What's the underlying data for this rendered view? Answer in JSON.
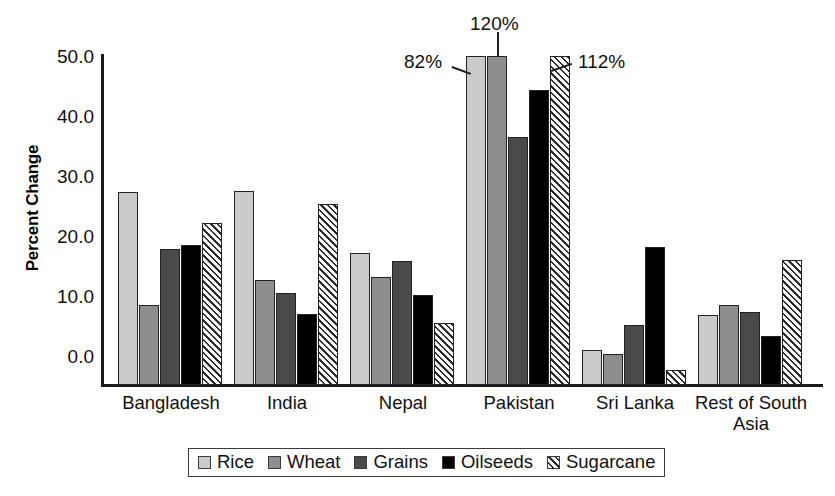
{
  "chart_data": {
    "type": "bar",
    "title": "",
    "xlabel": "",
    "ylabel": "Percent Change",
    "ylim": [
      0,
      55.5
    ],
    "yticks": [
      "0.0",
      "10.0",
      "20.0",
      "30.0",
      "40.0",
      "50.0"
    ],
    "ytick_values": [
      0,
      10,
      20,
      30,
      40,
      50
    ],
    "grid": false,
    "legend_position": "bottom",
    "categories": [
      "Bangladesh",
      "India",
      "Nepal",
      "Pakistan",
      "Sri Lanka",
      "Rest of South Asia"
    ],
    "category_labels": [
      {
        "line1": "Bangladesh",
        "line2": ""
      },
      {
        "line1": "India",
        "line2": ""
      },
      {
        "line1": "Nepal",
        "line2": ""
      },
      {
        "line1": "Pakistan",
        "line2": ""
      },
      {
        "line1": "Sri Lanka",
        "line2": ""
      },
      {
        "line1": "Rest of South",
        "line2": "Asia"
      }
    ],
    "series": [
      {
        "name": "Rice",
        "color": "#cbcbcb",
        "pattern": "solid-light-gray",
        "values": [
          32.5,
          32.7,
          22.3,
          82.0,
          5.9,
          11.8
        ]
      },
      {
        "name": "Wheat",
        "color": "#8d8d8d",
        "pattern": "solid-medium-gray",
        "values": [
          13.5,
          17.7,
          18.2,
          120.0,
          5.2,
          13.5
        ]
      },
      {
        "name": "Grains",
        "color": "#4a4a4a",
        "pattern": "solid-dark-gray",
        "values": [
          23.0,
          15.6,
          20.9,
          41.8,
          10.1,
          12.3
        ]
      },
      {
        "name": "Oilseeds",
        "color": "#000000",
        "pattern": "solid-black",
        "values": [
          23.7,
          12.0,
          15.2,
          49.8,
          23.3,
          8.2
        ]
      },
      {
        "name": "Sugarcane",
        "color": "#ffffff",
        "pattern": "diagonal-hatch",
        "values": [
          27.3,
          30.5,
          10.4,
          112.0,
          2.6,
          21.1
        ]
      }
    ],
    "clipped_bars": [
      {
        "category": "Pakistan",
        "series": "Rice",
        "label": "82%"
      },
      {
        "category": "Pakistan",
        "series": "Wheat",
        "label": "120%"
      },
      {
        "category": "Pakistan",
        "series": "Sugarcane",
        "label": "112%"
      }
    ],
    "annotations": [
      {
        "text": "82%"
      },
      {
        "text": "120%"
      },
      {
        "text": "112%"
      }
    ]
  },
  "legend": {
    "items": [
      {
        "label": "Rice"
      },
      {
        "label": "Wheat"
      },
      {
        "label": "Grains"
      },
      {
        "label": "Oilseeds"
      },
      {
        "label": "Sugarcane"
      }
    ]
  }
}
